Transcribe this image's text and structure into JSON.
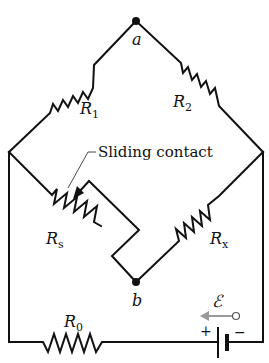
{
  "diagram": {
    "type": "Wheatstone bridge circuit",
    "nodes": {
      "a": {
        "label": "a"
      },
      "b": {
        "label": "b"
      }
    },
    "resistors": [
      {
        "id": "R1",
        "label_main": "R",
        "label_sub": "1"
      },
      {
        "id": "R2",
        "label_main": "R",
        "label_sub": "2"
      },
      {
        "id": "Rs",
        "label_main": "R",
        "label_sub": "s"
      },
      {
        "id": "Rx",
        "label_main": "R",
        "label_sub": "x"
      },
      {
        "id": "R0",
        "label_main": "R",
        "label_sub": "0"
      }
    ],
    "annotation": {
      "sliding_contact": "Sliding contact"
    },
    "battery": {
      "emf_label": "ℰ",
      "plus": "+",
      "minus": "−"
    },
    "colors": {
      "wire": "#111111",
      "emf_arrow": "#999999",
      "background": "#ffffff"
    }
  }
}
